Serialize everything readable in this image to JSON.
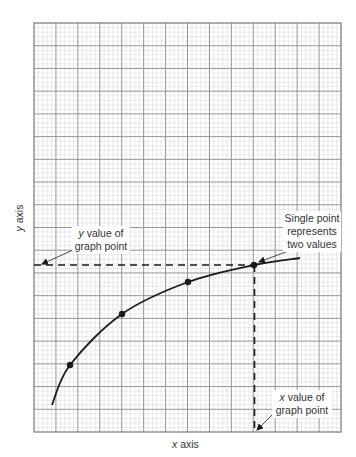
{
  "chart_data": {
    "type": "line",
    "title": "",
    "xlabel": "x axis",
    "ylabel": "y axis",
    "grid": true,
    "grid_major_columns": 14,
    "grid_major_rows": 18,
    "grid_minor_per_major": 5,
    "series": [
      {
        "name": "curve",
        "points_px": [
          [
            52,
            405
          ],
          [
            70,
            365
          ],
          [
            122,
            314
          ],
          [
            188,
            282
          ],
          [
            254,
            265
          ],
          [
            300,
            258
          ]
        ],
        "markers_px": [
          [
            70,
            365
          ],
          [
            122,
            314
          ],
          [
            188,
            282
          ],
          [
            254,
            265
          ]
        ]
      }
    ],
    "highlight_point_px": [
      254,
      265
    ],
    "annotations": [
      {
        "id": "y-value",
        "line1_italic": "y",
        "line1_rest": " value of",
        "line2": "graph point"
      },
      {
        "id": "single-point",
        "lines": [
          "Single point",
          "represents",
          "two values"
        ]
      },
      {
        "id": "x-value",
        "line1_italic": "x",
        "line1_rest": " value of",
        "line2": "graph point"
      }
    ]
  },
  "labels": {
    "y_value_italic": "y",
    "y_value_rest": " value of",
    "y_value_line2": "graph point",
    "single_line1": "Single point",
    "single_line2": "represents",
    "single_line3": "two values",
    "x_value_italic": "x",
    "x_value_rest": " value of",
    "x_value_line2": "graph point",
    "x_axis_italic": "x",
    "x_axis_rest": " axis",
    "y_axis_italic": "y",
    "y_axis_rest": " axis"
  },
  "colors": {
    "grid_minor": "#d6d6d6",
    "grid_major": "#8a8a8a",
    "border": "#777777",
    "curve": "#1a1a1a",
    "text": "#333333"
  }
}
